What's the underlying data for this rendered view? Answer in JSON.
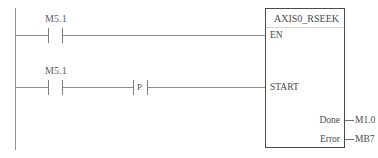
{
  "diagram": {
    "type": "ladder-logic",
    "language": "LAD",
    "rails": {
      "left_rail": true,
      "right_rail": false
    },
    "rungs": [
      {
        "id": "rung-1",
        "contacts": [
          {
            "kind": "normally-open",
            "label": "M5.1"
          }
        ],
        "target_pin": "EN"
      },
      {
        "id": "rung-2",
        "contacts": [
          {
            "kind": "normally-open",
            "label": "M5.1"
          },
          {
            "kind": "positive-edge",
            "label": "P"
          }
        ],
        "target_pin": "START"
      }
    ]
  },
  "function_block": {
    "title": "AXIS0_RSEEK",
    "inputs": [
      {
        "name": "EN"
      },
      {
        "name": "START"
      }
    ],
    "outputs": [
      {
        "name": "Done",
        "operand": "M1.0"
      },
      {
        "name": "Error",
        "operand": "MB7"
      }
    ]
  },
  "colors": {
    "line": "#8d8d8d",
    "block_border": "#4a4a4a",
    "text": "#4b4b4b",
    "label_text": "#5a5a5a",
    "background": "#ffffff"
  }
}
